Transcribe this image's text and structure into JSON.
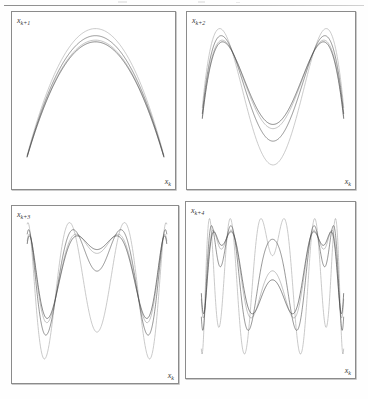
{
  "figure": {
    "type": "multi-panel-return-map",
    "background_color": "#ffffff",
    "curve_color": "#2b2b2b",
    "border_color": "#8b8b8b",
    "panel_count": 4,
    "columns": 2,
    "rows": 2,
    "top_rule": true
  },
  "panels": [
    {
      "id": "panel-1",
      "position": "top-left",
      "ylabel": "x",
      "ylabel_sub": "k+1",
      "xlabel": "x",
      "xlabel_sub": "k",
      "iterate": 1,
      "humps": 1,
      "curve_count": 4
    },
    {
      "id": "panel-2",
      "position": "top-right",
      "ylabel": "x",
      "ylabel_sub": "k+2",
      "xlabel": "x",
      "xlabel_sub": "k",
      "iterate": 2,
      "humps": 2,
      "curve_count": 4
    },
    {
      "id": "panel-3",
      "position": "bottom-left",
      "ylabel": "x",
      "ylabel_sub": "k+3",
      "xlabel": "x",
      "xlabel_sub": "k",
      "iterate": 3,
      "humps": 4,
      "curve_count": 4
    },
    {
      "id": "panel-4",
      "position": "bottom-right",
      "ylabel": "x",
      "ylabel_sub": "k+4",
      "xlabel": "x",
      "xlabel_sub": "k",
      "iterate": 4,
      "humps": 8,
      "curve_count": 4
    }
  ],
  "chart_data": {
    "type": "line",
    "title": "",
    "xlabel": "x_k",
    "ylabel": "x_{k+n}",
    "grid": false,
    "legend": "none",
    "xlim": [
      0,
      1
    ],
    "ylim": [
      0,
      1
    ],
    "map_family": "logistic",
    "map_formula": "x_{k+1} = r * x_k * (1 - x_k)",
    "series": [
      {
        "name": "r = 3.575",
        "iterates": [
          1,
          2,
          3,
          4
        ],
        "r": 3.575
      },
      {
        "name": "r = 3.62",
        "iterates": [
          1,
          2,
          3,
          4
        ],
        "r": 3.62
      },
      {
        "name": "r = 3.74",
        "iterates": [
          1,
          2,
          3,
          4
        ],
        "r": 3.74
      },
      {
        "name": "r = 3.93",
        "iterates": [
          1,
          2,
          3,
          4
        ],
        "r": 3.93
      }
    ],
    "samples_per_curve": 600,
    "note": "Each panel plots the n-th iterate of the map over x_k in [0,1]; higher n yields 2^(n-1) humps."
  }
}
